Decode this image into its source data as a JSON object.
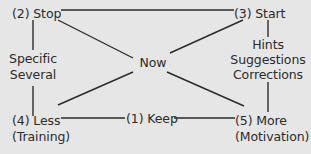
{
  "diagram": {
    "nodes": {
      "stop": {
        "label": "(2) Stop"
      },
      "start": {
        "label": "(3) Start"
      },
      "now": {
        "label": "Now"
      },
      "less": {
        "label": "(4) Less",
        "sub": "(Training)"
      },
      "keep": {
        "label": "(1) Keep"
      },
      "more": {
        "label": "(5) More",
        "sub": "(Motivation)"
      }
    },
    "edge_labels": {
      "stop_less": [
        "Specific",
        "Several"
      ],
      "start_more": [
        "Hints",
        "Suggestions",
        "Corrections"
      ]
    },
    "edges": [
      [
        "stop",
        "start"
      ],
      [
        "stop",
        "less"
      ],
      [
        "start",
        "more"
      ],
      [
        "less",
        "keep"
      ],
      [
        "keep",
        "more"
      ],
      [
        "stop",
        "now"
      ],
      [
        "now",
        "more"
      ],
      [
        "start",
        "now"
      ],
      [
        "now",
        "less"
      ]
    ],
    "colors": {
      "background": "#e6e6e6",
      "line": "#2b2b2b",
      "text": "#2b2b2b"
    }
  }
}
